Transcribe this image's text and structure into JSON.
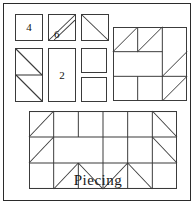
{
  "figure": {
    "caption": "Piecing",
    "border_color": "#2b2b2b",
    "line_color": "#3a3a3a",
    "background": "#ffffff"
  },
  "cut_pieces": {
    "title": "cut-pieces-legend",
    "items": [
      {
        "name": "plain-square-4",
        "label": "4",
        "shape": "square",
        "x": 14,
        "y": 13,
        "w": 28,
        "h": 27,
        "diagonals": []
      },
      {
        "name": "narrow-strip-6",
        "label": "6",
        "shape": "double-diagonal-strip",
        "x": 47,
        "y": 13,
        "w": 28,
        "h": 27,
        "diagonals": [
          "tr-bl",
          "tr-bl-offset"
        ]
      },
      {
        "name": "half-square-triangle-top",
        "label": "",
        "shape": "hst",
        "x": 80,
        "y": 13,
        "w": 28,
        "h": 27,
        "diagonals": [
          "tl-br"
        ]
      },
      {
        "name": "half-square-triangle-pair",
        "label": "",
        "shape": "hst-stack",
        "x": 14,
        "y": 47,
        "w": 28,
        "h": 54,
        "diagonals": [
          "tl-br",
          "tl-br"
        ]
      },
      {
        "name": "rectangle-2",
        "label": "2",
        "shape": "rectangle",
        "x": 47,
        "y": 47,
        "w": 28,
        "h": 54,
        "diagonals": []
      },
      {
        "name": "plain-square-upper",
        "label": "",
        "shape": "square",
        "x": 80,
        "y": 47,
        "w": 26,
        "h": 25,
        "diagonals": []
      },
      {
        "name": "plain-square-lower",
        "label": "",
        "shape": "square",
        "x": 80,
        "y": 76,
        "w": 26,
        "h": 25,
        "diagonals": []
      }
    ]
  },
  "block_quarter": {
    "name": "quarter-block-diagram",
    "x": 112,
    "y": 26,
    "w": 74,
    "h": 74,
    "cols": 3,
    "rows": 3,
    "grid_lines": {
      "vertical": [
        0.3333,
        0.6667
      ],
      "horizontal": [
        0.3333,
        0.6667
      ]
    },
    "partial_lines": [
      {
        "type": "h",
        "y": 0.3333,
        "x1": 0.0,
        "x2": 0.6667
      },
      {
        "type": "h",
        "y": 0.6667,
        "x1": 0.0,
        "x2": 1.0
      },
      {
        "type": "v",
        "x": 0.3333,
        "y1": 0.0,
        "y2": 0.3333
      },
      {
        "type": "v",
        "x": 0.3333,
        "y1": 0.6667,
        "y2": 1.0
      },
      {
        "type": "v",
        "x": 0.6667,
        "y1": 0.0,
        "y2": 1.0
      }
    ],
    "triangles": [
      {
        "cell": "r0c0",
        "diagonal": "bl-tr"
      },
      {
        "cell": "r0c1",
        "diagonal": "bl-tr"
      },
      {
        "cell": "r1c2",
        "diagonal": "bl-tr"
      },
      {
        "cell": "r2c2",
        "diagonal": "bl-tr"
      }
    ]
  },
  "block_full": {
    "name": "full-block-diagram",
    "x": 28,
    "y": 110,
    "w": 148,
    "h": 78,
    "cols": 6,
    "rows": 3,
    "triangles": [
      {
        "cell": "r0c0",
        "diagonal": "bl-tr"
      },
      {
        "cell": "r0c5",
        "diagonal": "tl-br"
      },
      {
        "cell": "r1c0",
        "diagonal": "bl-tr"
      },
      {
        "cell": "r1c5",
        "diagonal": "tl-br"
      },
      {
        "cell": "r2c1",
        "diagonal": "bl-tr"
      },
      {
        "cell": "r2c2",
        "diagonal": "tl-br"
      },
      {
        "cell": "r2c3",
        "diagonal": "bl-tr"
      },
      {
        "cell": "r2c4",
        "diagonal": "tl-br"
      },
      {
        "cell": "r2c0",
        "diagonal": "none"
      },
      {
        "cell": "r2c5",
        "diagonal": "none"
      }
    ],
    "merged_regions": [
      {
        "name": "top-center-wide",
        "r": 0,
        "c": 1,
        "span_c": 1
      },
      {
        "name": "middle-center-wide",
        "r": 1,
        "c": 1,
        "span_c": 3
      }
    ]
  }
}
